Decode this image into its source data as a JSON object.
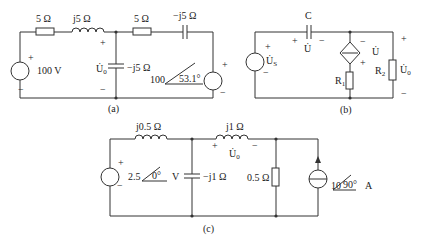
{
  "circuit_a": {
    "caption": "(a)",
    "r1": "5 Ω",
    "l1": "j5 Ω",
    "r2": "5 Ω",
    "c_top": "−j5 Ω",
    "c_mid": "−j5 Ω",
    "source_left": "100 V",
    "u0": "U̇",
    "u0_sub": "0",
    "source_right_mag": "100",
    "source_right_angle": "53.1°",
    "plus": "+",
    "minus": "−"
  },
  "circuit_b": {
    "caption": "(b)",
    "cap": "C",
    "u": "U̇",
    "us": "U̇",
    "us_sub": "S",
    "r1": "R",
    "r1_sub": "1",
    "r2": "R",
    "r2_sub": "2",
    "u0": "U̇",
    "u0_sub": "0",
    "plus": "+",
    "minus": "−"
  },
  "circuit_c": {
    "caption": "(c)",
    "l1": "j0.5 Ω",
    "l2": "j1 Ω",
    "cap": "−j1 Ω",
    "res": "0.5 Ω",
    "vs_mag": "2.5",
    "vs_angle": "0°",
    "vs_unit": "V",
    "is_mag": "10",
    "is_angle": "90°",
    "is_unit": "A",
    "u0": "U̇",
    "u0_sub": "0",
    "plus": "+",
    "minus": "−"
  }
}
